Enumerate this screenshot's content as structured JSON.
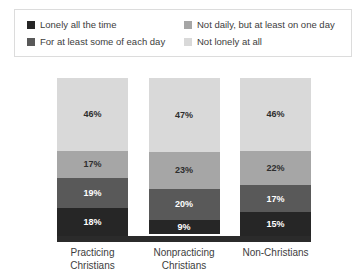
{
  "legend": {
    "items": [
      {
        "label": "Lonely all the time",
        "color": "#262626",
        "swatch_icon": "legend-swatch-icon"
      },
      {
        "label": "Not daily, but at least on one day",
        "color": "#a6a6a6",
        "swatch_icon": "legend-swatch-icon"
      },
      {
        "label": "For at least some of each day",
        "color": "#595959",
        "swatch_icon": "legend-swatch-icon"
      },
      {
        "label": "Not lonely at all",
        "color": "#d9d9d9",
        "swatch_icon": "legend-swatch-icon"
      }
    ]
  },
  "chart_data": {
    "type": "bar",
    "subtype": "stacked-100-percent",
    "title": "",
    "xlabel": "",
    "ylabel": "",
    "ylim": [
      0,
      100
    ],
    "grid": false,
    "legend_position": "top",
    "categories": [
      "Practicing Christians",
      "Nonpracticing Christians",
      "Non-Christians"
    ],
    "category_lines": [
      [
        "Practicing",
        "Christians"
      ],
      [
        "Nonpracticing",
        "Christians"
      ],
      [
        "Non-Christians",
        ""
      ]
    ],
    "stack_order_bottom_to_top": [
      "Lonely all the time",
      "For at least some of each day",
      "Not daily, but at least on one day",
      "Not lonely at all"
    ],
    "series": [
      {
        "name": "Lonely all the time",
        "color": "#262626",
        "values": [
          18,
          9,
          15
        ],
        "labels": [
          "18%",
          "9%",
          "15%"
        ]
      },
      {
        "name": "For at least some of each day",
        "color": "#595959",
        "values": [
          19,
          20,
          17
        ],
        "labels": [
          "19%",
          "20%",
          "17%"
        ]
      },
      {
        "name": "Not daily, but at least on one day",
        "color": "#a6a6a6",
        "values": [
          17,
          23,
          22
        ],
        "labels": [
          "17%",
          "23%",
          "22%"
        ]
      },
      {
        "name": "Not lonely at all",
        "color": "#d9d9d9",
        "values": [
          46,
          47,
          46
        ],
        "labels": [
          "46%",
          "47%",
          "46%"
        ]
      }
    ]
  }
}
